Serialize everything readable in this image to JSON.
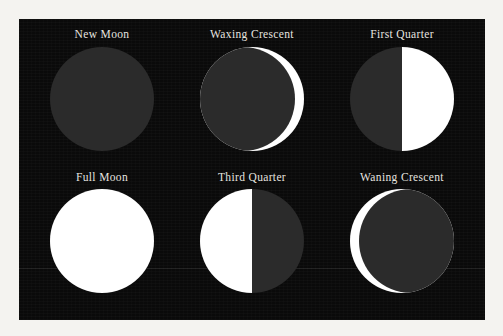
{
  "figure": {
    "background_color": "#0a0a0a",
    "page_color": "#f4f3f0",
    "label_color": "#e8e6e0",
    "lit_color": "#ffffff",
    "unlit_color": "#2b2b2b"
  },
  "chart_data": {
    "type": "diagram",
    "title": "",
    "layout": {
      "rows": 2,
      "columns": 3,
      "order": "left-to-right, top-to-bottom"
    },
    "phases": [
      {
        "label": "New Moon",
        "illumination_percent": 0,
        "lit_side": "none",
        "shape": "disc-unlit",
        "row": 1,
        "column": 1
      },
      {
        "label": "Waxing Crescent",
        "illumination_percent": 8,
        "lit_side": "right",
        "shape": "crescent",
        "row": 1,
        "column": 2
      },
      {
        "label": "First Quarter",
        "illumination_percent": 50,
        "lit_side": "right",
        "shape": "half",
        "row": 1,
        "column": 3
      },
      {
        "label": "Full Moon",
        "illumination_percent": 100,
        "lit_side": "all",
        "shape": "disc-lit",
        "row": 2,
        "column": 1
      },
      {
        "label": "Third Quarter",
        "illumination_percent": 50,
        "lit_side": "left",
        "shape": "half",
        "row": 2,
        "column": 2
      },
      {
        "label": "Waning Crescent",
        "illumination_percent": 8,
        "lit_side": "left",
        "shape": "crescent",
        "row": 2,
        "column": 3
      }
    ]
  }
}
